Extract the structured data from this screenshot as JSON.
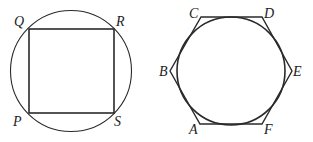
{
  "figures": [
    {
      "name": "square-inscribed-in-circle",
      "labels": [
        "Q",
        "R",
        "P",
        "S"
      ]
    },
    {
      "name": "circle-inscribed-in-hexagon",
      "labels": [
        "C",
        "D",
        "B",
        "E",
        "A",
        "F"
      ]
    }
  ],
  "colors": {
    "stroke": "#2a2a2a",
    "background": "#ffffff"
  }
}
